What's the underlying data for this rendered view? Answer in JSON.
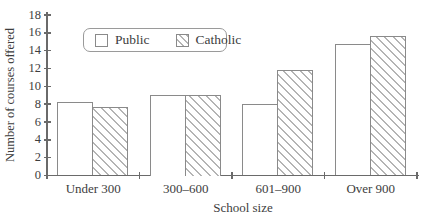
{
  "chart_data": {
    "type": "bar",
    "categories": [
      "Under 300",
      "300–600",
      "601–900",
      "Over 900"
    ],
    "series": [
      {
        "name": "Public",
        "style": "plain",
        "values": [
          8.2,
          9.0,
          8.0,
          14.8
        ]
      },
      {
        "name": "Catholic",
        "style": "hatched",
        "values": [
          7.7,
          9.0,
          11.8,
          15.6
        ]
      }
    ],
    "xlabel": "School size",
    "ylabel": "Number of courses offered",
    "ylim": [
      0,
      18
    ],
    "yticks": [
      0,
      2,
      4,
      6,
      8,
      10,
      12,
      14,
      16,
      18
    ],
    "grid": false,
    "legend_position": "top-inside"
  },
  "colors": {
    "background": "#ffffff",
    "axis": "#6a6a6a",
    "text": "#3d3d3d",
    "bar_border": "#8a8a8a",
    "bar_fill": "#ffffff",
    "hatch_line": "#b4b4b4",
    "legend_border": "#9a9a9a"
  }
}
